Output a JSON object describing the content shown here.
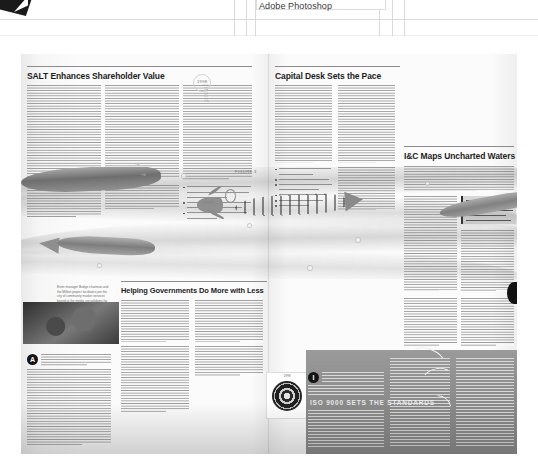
{
  "app": {
    "name": "Adobe Photoshop",
    "previous_row_label": "",
    "logo_icon": "photoshop-logo-icon"
  },
  "document": {
    "type": "magazine-spread-preview",
    "page_background": "#fbfbfb",
    "ink_color": "#1d1d1d",
    "accent_dark": "#141414",
    "panel_gray": "#8e8e8e"
  },
  "articles": {
    "left_top": {
      "headline": "SALT Enhances Shareholder Value",
      "kicker": "1998"
    },
    "center_top": {
      "headline": "Capital Desk Sets the Pace"
    },
    "right_top": {
      "headline": "I&C Maps Uncharted Waters"
    },
    "center_bottom": {
      "headline": "Helping Governments Do More with Less"
    },
    "right_bottom": {
      "headline": "ISO 9000 SETS THE STANDARDS"
    }
  },
  "illustration": {
    "caption": "Enter manager Bridge chairman and the Million project facilitates join the city of community market services based at the media consolidates for an composite limited unified lifting.",
    "figure_label": "FIGURE 3",
    "subjects": [
      "striped-fish",
      "small-fish",
      "tail-fish",
      "waves",
      "bubbles"
    ]
  },
  "photos": {
    "woman_portrait": "portrait-photo",
    "seal_emblem": "seal-emblem-photo",
    "seal_caption": "1998"
  },
  "dropcaps": {
    "center_bottom": "A",
    "right_bottom": "I"
  },
  "watermark": "proof",
  "icons": {
    "arrow_pointer": "arrow-icon",
    "bullet": "bullet-dot-icon"
  }
}
